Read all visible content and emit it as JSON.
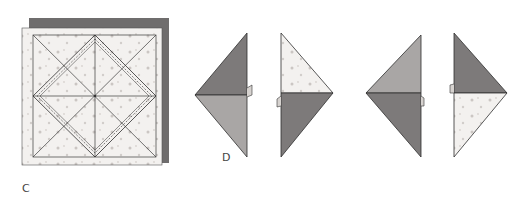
{
  "figure": {
    "colors": {
      "background": "#ffffff",
      "paper_light": "#f3f1ef",
      "paper_dots": "#c9c3c0",
      "paper_mid": "#a9a6a5",
      "paper_dark": "#7d7a7a",
      "shadow": "#6f6d6d",
      "line": "#3a3a3a"
    }
  },
  "steps": [
    {
      "id": "C",
      "label": "C"
    },
    {
      "id": "D",
      "label": "D"
    }
  ],
  "diamonds": [
    {
      "name": "diamond-1",
      "top_shade": "dark",
      "bottom_shade": "mid",
      "point": "left"
    },
    {
      "name": "diamond-2",
      "top_shade": "light-dotted",
      "bottom_shade": "dark",
      "point": "right"
    },
    {
      "name": "diamond-3",
      "top_shade": "mid",
      "bottom_shade": "dark",
      "point": "left"
    },
    {
      "name": "diamond-4",
      "top_shade": "dark",
      "bottom_shade": "light-dotted",
      "point": "right"
    }
  ]
}
